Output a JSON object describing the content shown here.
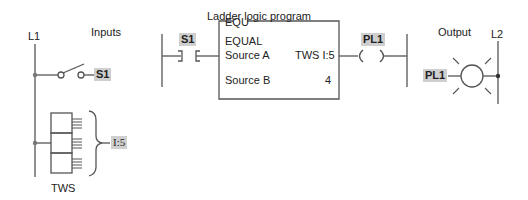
{
  "diagram": {
    "left_rail_label": "L1",
    "right_rail_label": "L2",
    "inputs_label": "Inputs",
    "output_label": "Output",
    "program_title": "Ladder logic program",
    "input_switch": {
      "tag": "S1"
    },
    "thumbwheel": {
      "name": "TWS",
      "address": "I:5"
    },
    "ladder": {
      "contact_tag": "S1",
      "instruction": {
        "mnemonic": "EQU",
        "name": "EQUAL",
        "source_a_label": "Source A",
        "source_a_value": "TWS  I:5",
        "source_b_label": "Source B",
        "source_b_value": "4"
      },
      "coil_tag": "PL1"
    },
    "pilot_light": {
      "tag": "PL1"
    }
  }
}
